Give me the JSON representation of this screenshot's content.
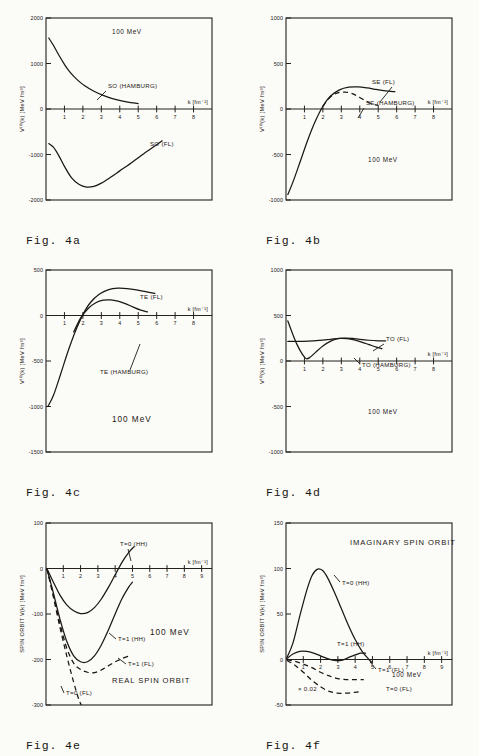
{
  "figure": {
    "energy_note": "100 MeV"
  },
  "chart_data": [
    {
      "id": "4a",
      "type": "line",
      "caption": "Fig. 4a",
      "title": "",
      "xlabel": "k [fm⁻¹]",
      "ylabel": "V⁽⁰⁾(k)  [MeV fm³]",
      "annotation": "100 MeV",
      "xlim": [
        0,
        9
      ],
      "ylim": [
        -2000,
        2000
      ],
      "xticks": [
        1,
        2,
        3,
        4,
        5,
        6,
        7,
        8
      ],
      "yticks": [
        2000,
        1000,
        0,
        -1000,
        -2000
      ],
      "yticklabels": [
        "2000",
        "1000",
        "0",
        "-1000",
        "-2000"
      ],
      "grid": false,
      "series": [
        {
          "name": "SO (HAMBURG)",
          "style": "solid",
          "points": [
            [
              0.15,
              1560
            ],
            [
              0.4,
              1400
            ],
            [
              0.7,
              1180
            ],
            [
              1.0,
              980
            ],
            [
              1.3,
              810
            ],
            [
              1.7,
              640
            ],
            [
              2.1,
              510
            ],
            [
              2.6,
              390
            ],
            [
              3.1,
              300
            ],
            [
              3.6,
              230
            ],
            [
              4.1,
              180
            ],
            [
              4.6,
              140
            ],
            [
              5.0,
              120
            ]
          ]
        },
        {
          "name": "SO (FL)",
          "style": "solid",
          "points": [
            [
              0.15,
              -760
            ],
            [
              0.4,
              -840
            ],
            [
              0.7,
              -1030
            ],
            [
              1.0,
              -1260
            ],
            [
              1.4,
              -1520
            ],
            [
              1.8,
              -1660
            ],
            [
              2.2,
              -1715
            ],
            [
              2.6,
              -1700
            ],
            [
              3.0,
              -1630
            ],
            [
              3.5,
              -1500
            ],
            [
              4.0,
              -1360
            ],
            [
              4.6,
              -1190
            ],
            [
              5.2,
              -1010
            ],
            [
              5.8,
              -840
            ],
            [
              6.3,
              -700
            ]
          ]
        }
      ]
    },
    {
      "id": "4b",
      "type": "line",
      "caption": "Fig. 4b",
      "title": "",
      "xlabel": "k [fm⁻¹]",
      "ylabel": "V⁽⁰⁾(k)  [MeV fm³]",
      "annotation": "100 MeV",
      "xlim": [
        0,
        9
      ],
      "ylim": [
        -1000,
        1000
      ],
      "xticks": [
        1,
        2,
        3,
        4,
        5,
        6,
        7,
        8
      ],
      "yticks": [
        1000,
        500,
        0,
        -500,
        -1000
      ],
      "yticklabels": [
        "1000",
        "500",
        "0",
        "-500",
        "-1000"
      ],
      "grid": false,
      "series": [
        {
          "name": "SE (FL)",
          "style": "solid",
          "points": [
            [
              0.1,
              -940
            ],
            [
              0.4,
              -790
            ],
            [
              0.8,
              -560
            ],
            [
              1.2,
              -330
            ],
            [
              1.6,
              -130
            ],
            [
              2.0,
              30
            ],
            [
              2.4,
              140
            ],
            [
              2.9,
              210
            ],
            [
              3.4,
              240
            ],
            [
              3.9,
              243
            ],
            [
              4.4,
              232
            ],
            [
              4.9,
              215
            ],
            [
              5.4,
              200
            ],
            [
              5.9,
              190
            ]
          ]
        },
        {
          "name": "SE (HAMBURG)",
          "style": "dashed",
          "points": [
            [
              2.0,
              30
            ],
            [
              2.3,
              110
            ],
            [
              2.6,
              160
            ],
            [
              2.9,
              182
            ],
            [
              3.2,
              186
            ],
            [
              3.5,
              176
            ],
            [
              3.8,
              150
            ],
            [
              4.1,
              115
            ],
            [
              4.4,
              80
            ],
            [
              4.7,
              55
            ],
            [
              5.0,
              40
            ]
          ]
        }
      ]
    },
    {
      "id": "4c",
      "type": "line",
      "caption": "Fig. 4c",
      "title": "",
      "xlabel": "k [fm⁻¹]",
      "ylabel": "V⁽⁰⁾(k)  [MeV fm³]",
      "annotation": "100 MeV",
      "xlim": [
        0,
        9
      ],
      "ylim": [
        -1500,
        500
      ],
      "xticks": [
        1,
        2,
        3,
        4,
        5,
        6,
        7,
        8
      ],
      "yticks": [
        500,
        0,
        -500,
        -1000,
        -1500
      ],
      "yticklabels": [
        "500",
        "0",
        "-500",
        "-1000",
        "-1500"
      ],
      "grid": false,
      "series": [
        {
          "name": "TE (FL)",
          "style": "solid",
          "points": [
            [
              0.1,
              -1000
            ],
            [
              0.4,
              -880
            ],
            [
              0.8,
              -640
            ],
            [
              1.2,
              -390
            ],
            [
              1.6,
              -170
            ],
            [
              2.0,
              10
            ],
            [
              2.4,
              140
            ],
            [
              2.9,
              235
            ],
            [
              3.4,
              285
            ],
            [
              3.9,
              300
            ],
            [
              4.4,
              296
            ],
            [
              4.9,
              282
            ],
            [
              5.4,
              262
            ],
            [
              5.9,
              242
            ]
          ]
        },
        {
          "name": "TE (HAMBURG)",
          "style": "solid",
          "points": [
            [
              1.5,
              -180
            ],
            [
              1.9,
              -20
            ],
            [
              2.3,
              80
            ],
            [
              2.7,
              140
            ],
            [
              3.1,
              168
            ],
            [
              3.5,
              172
            ],
            [
              3.9,
              158
            ],
            [
              4.3,
              130
            ],
            [
              4.7,
              95
            ],
            [
              5.1,
              62
            ],
            [
              5.5,
              40
            ]
          ]
        }
      ]
    },
    {
      "id": "4d",
      "type": "line",
      "caption": "Fig. 4d",
      "title": "",
      "xlabel": "k [fm⁻¹]",
      "ylabel": "V⁽⁰⁾(k)  [MeV fm³]",
      "annotation": "100 MeV",
      "xlim": [
        0,
        9
      ],
      "ylim": [
        -1000,
        1000
      ],
      "xticks": [
        1,
        2,
        3,
        4,
        5,
        6,
        7,
        8
      ],
      "yticks": [
        1000,
        500,
        0,
        -500,
        -1000
      ],
      "yticklabels": [
        "1000",
        "500",
        "0",
        "-500",
        "-1000"
      ],
      "grid": false,
      "series": [
        {
          "name": "TO (FL)",
          "style": "solid",
          "points": [
            [
              0.1,
              440
            ],
            [
              0.3,
              330
            ],
            [
              0.6,
              180
            ],
            [
              0.9,
              70
            ],
            [
              1.1,
              25
            ],
            [
              1.3,
              40
            ],
            [
              1.6,
              95
            ],
            [
              2.0,
              165
            ],
            [
              2.4,
              215
            ],
            [
              2.8,
              245
            ],
            [
              3.2,
              252
            ],
            [
              3.6,
              248
            ],
            [
              4.0,
              238
            ],
            [
              4.5,
              228
            ],
            [
              5.0,
              222
            ],
            [
              5.4,
              220
            ]
          ]
        },
        {
          "name": "TO (HAMBURG)",
          "style": "solid",
          "points": [
            [
              0.1,
              215
            ],
            [
              0.6,
              215
            ],
            [
              1.2,
              218
            ],
            [
              1.8,
              226
            ],
            [
              2.4,
              238
            ],
            [
              2.9,
              248
            ],
            [
              3.3,
              246
            ],
            [
              3.7,
              232
            ],
            [
              4.1,
              208
            ],
            [
              4.5,
              180
            ],
            [
              4.9,
              152
            ],
            [
              5.2,
              135
            ]
          ]
        }
      ]
    },
    {
      "id": "4e",
      "type": "line",
      "caption": "Fig. 4e",
      "title": "REAL SPIN ORBIT",
      "xlabel": "k [fm⁻¹]",
      "ylabel": "SPIN ORBIT V(k)  [MeV fm³]",
      "annotation": "100 MeV",
      "xlim": [
        0,
        9.6
      ],
      "ylim": [
        -300,
        100
      ],
      "xticks": [
        1,
        2,
        3,
        4,
        5,
        6,
        7,
        8,
        9
      ],
      "yticks": [
        100,
        0,
        -100,
        -200,
        -300
      ],
      "yticklabels": [
        "100",
        "0",
        "-100",
        "-200",
        "-300"
      ],
      "grid": false,
      "series": [
        {
          "name": "T=0 (HH)",
          "style": "solid",
          "points": [
            [
              0.05,
              0
            ],
            [
              0.4,
              -28
            ],
            [
              0.8,
              -58
            ],
            [
              1.2,
              -80
            ],
            [
              1.6,
              -93
            ],
            [
              2.0,
              -99
            ],
            [
              2.4,
              -97
            ],
            [
              2.8,
              -86
            ],
            [
              3.2,
              -67
            ],
            [
              3.6,
              -42
            ],
            [
              4.0,
              -14
            ],
            [
              4.4,
              14
            ],
            [
              4.8,
              36
            ],
            [
              5.1,
              48
            ]
          ]
        },
        {
          "name": "T=1 (HH)",
          "style": "solid",
          "points": [
            [
              0.05,
              0
            ],
            [
              0.4,
              -50
            ],
            [
              0.8,
              -110
            ],
            [
              1.2,
              -160
            ],
            [
              1.6,
              -192
            ],
            [
              2.0,
              -205
            ],
            [
              2.4,
              -205
            ],
            [
              2.8,
              -192
            ],
            [
              3.2,
              -168
            ],
            [
              3.6,
              -136
            ],
            [
              4.0,
              -100
            ],
            [
              4.4,
              -66
            ],
            [
              4.8,
              -40
            ],
            [
              5.0,
              -30
            ]
          ]
        },
        {
          "name": "T=1 (FL)",
          "style": "dashed",
          "points": [
            [
              0.05,
              0
            ],
            [
              0.4,
              -54
            ],
            [
              0.8,
              -120
            ],
            [
              1.2,
              -175
            ],
            [
              1.6,
              -208
            ],
            [
              2.0,
              -222
            ],
            [
              2.4,
              -228
            ],
            [
              2.8,
              -229
            ],
            [
              3.2,
              -223
            ],
            [
              3.6,
              -214
            ],
            [
              4.0,
              -205
            ],
            [
              4.4,
              -198
            ],
            [
              4.8,
              -192
            ]
          ]
        },
        {
          "name": "T=0 (FL)",
          "style": "dashed",
          "points": [
            [
              0.05,
              0
            ],
            [
              0.4,
              -58
            ],
            [
              0.8,
              -128
            ],
            [
              1.2,
              -192
            ],
            [
              1.6,
              -250
            ],
            [
              1.9,
              -288
            ],
            [
              2.05,
              -300
            ]
          ]
        }
      ]
    },
    {
      "id": "4f",
      "type": "line",
      "caption": "Fig. 4f",
      "title": "IMAGINARY SPIN ORBIT",
      "xlabel": "k [fm⁻¹]",
      "ylabel": "SPIN ORBIT V(k)  [MeV fm³]",
      "annotation": "100 MeV",
      "scale_note": "× 0.02",
      "xlim": [
        0,
        9.6
      ],
      "ylim": [
        -50,
        150
      ],
      "xticks": [
        1,
        2,
        3,
        4,
        5,
        6,
        7,
        8,
        9
      ],
      "yticks": [
        150,
        100,
        50,
        0,
        -50
      ],
      "yticklabels": [
        "150",
        "100",
        "50",
        "0",
        "-50"
      ],
      "grid": false,
      "series": [
        {
          "name": "T=0 (HH)",
          "style": "solid",
          "points": [
            [
              0.05,
              2
            ],
            [
              0.4,
              18
            ],
            [
              0.8,
              48
            ],
            [
              1.2,
              76
            ],
            [
              1.5,
              92
            ],
            [
              1.8,
              99
            ],
            [
              2.1,
              98
            ],
            [
              2.4,
              90
            ],
            [
              2.8,
              74
            ],
            [
              3.2,
              56
            ],
            [
              3.6,
              38
            ],
            [
              4.0,
              22
            ],
            [
              4.4,
              9
            ],
            [
              4.8,
              0
            ],
            [
              5.0,
              -4
            ]
          ]
        },
        {
          "name": "T=1 (HH)",
          "style": "solid",
          "points": [
            [
              0.05,
              1
            ],
            [
              0.4,
              6
            ],
            [
              0.8,
              9
            ],
            [
              1.2,
              9
            ],
            [
              1.6,
              7
            ],
            [
              2.0,
              4
            ],
            [
              2.4,
              1
            ],
            [
              2.8,
              -1
            ],
            [
              3.2,
              -1
            ],
            [
              3.6,
              2
            ],
            [
              4.0,
              5
            ],
            [
              4.3,
              7
            ],
            [
              4.6,
              7
            ]
          ]
        },
        {
          "name": "T=1 (FL)",
          "style": "dashed",
          "points": [
            [
              0.05,
              0
            ],
            [
              0.5,
              -2
            ],
            [
              1.0,
              -5
            ],
            [
              1.5,
              -9
            ],
            [
              2.0,
              -14
            ],
            [
              2.5,
              -18
            ],
            [
              3.0,
              -21
            ],
            [
              3.5,
              -22
            ],
            [
              4.0,
              -22
            ],
            [
              4.5,
              -22
            ]
          ]
        },
        {
          "name": "T=0 (FL)",
          "style": "dashed",
          "points": [
            [
              0.05,
              -1
            ],
            [
              0.5,
              -6
            ],
            [
              1.0,
              -14
            ],
            [
              1.5,
              -23
            ],
            [
              2.0,
              -30
            ],
            [
              2.5,
              -35
            ],
            [
              3.0,
              -37
            ],
            [
              3.5,
              -37
            ],
            [
              4.0,
              -36
            ],
            [
              4.4,
              -35
            ]
          ]
        }
      ]
    }
  ]
}
